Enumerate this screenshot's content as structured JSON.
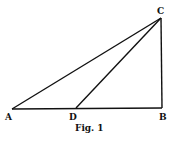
{
  "figure": {
    "caption": "Fig. 1",
    "points": {
      "A": {
        "label": "A",
        "x": 12,
        "y": 109
      },
      "D": {
        "label": "D",
        "x": 76,
        "y": 108
      },
      "B": {
        "label": "B",
        "x": 162,
        "y": 108
      },
      "C": {
        "label": "C",
        "x": 161,
        "y": 18
      }
    },
    "segments": [
      [
        "A",
        "B"
      ],
      [
        "B",
        "C"
      ],
      [
        "C",
        "A"
      ],
      [
        "C",
        "D"
      ]
    ],
    "line_color": "#111111"
  }
}
